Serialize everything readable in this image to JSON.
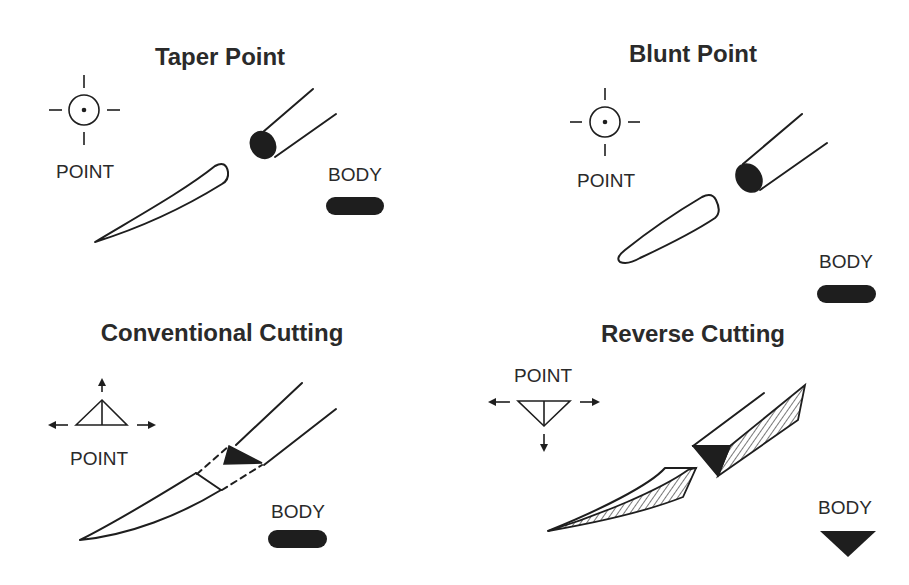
{
  "diagram": {
    "panels": [
      {
        "title": "Taper Point",
        "point_label": "POINT",
        "body_label": "BODY",
        "point_symbol": "circle-with-center-dot-crosshair",
        "body_symbol": "filled-oval"
      },
      {
        "title": "Blunt Point",
        "point_label": "POINT",
        "body_label": "BODY",
        "point_symbol": "circle-with-center-dot-crosshair",
        "body_symbol": "filled-oval"
      },
      {
        "title": "Conventional Cutting",
        "point_label": "POINT",
        "body_label": "BODY",
        "point_symbol": "upward-triangle-with-arrows",
        "body_symbol": "filled-oval"
      },
      {
        "title": "Reverse Cutting",
        "point_label": "POINT",
        "body_label": "BODY",
        "point_symbol": "downward-triangle-with-arrows",
        "body_symbol": "filled-downward-triangle"
      }
    ],
    "colors": {
      "ink": "#1e1e1e",
      "text": "#2a2a2a",
      "background": "#ffffff"
    }
  }
}
